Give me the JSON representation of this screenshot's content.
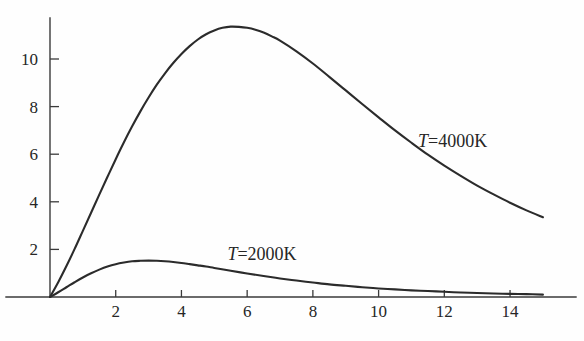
{
  "chart_data": {
    "type": "line",
    "title": "",
    "subtitle": "",
    "xlabel": "",
    "ylabel": "",
    "xlim": [
      0,
      15.1
    ],
    "ylim": [
      0,
      11.9
    ],
    "grid": false,
    "legend_position": "inline-annotation",
    "x_ticks": [
      "2",
      "4",
      "6",
      "8",
      "10",
      "12",
      "14"
    ],
    "x_tick_values": [
      2,
      4,
      6,
      8,
      10,
      12,
      14
    ],
    "y_ticks": [
      "2",
      "4",
      "6",
      "8",
      "10"
    ],
    "y_tick_values": [
      2,
      4,
      6,
      8,
      10
    ],
    "annotations": [
      {
        "text_var": "T",
        "text_eq": "=4000K",
        "x": 11.2,
        "y": 6.5
      },
      {
        "text_var": "T",
        "text_eq": "=2000K",
        "x": 5.4,
        "y": 1.75
      }
    ],
    "series": [
      {
        "name": "T=4000K",
        "color": "#2b2b2b",
        "peak_x": 5.65,
        "peak_y": 11.35,
        "x": [
          0,
          0.25,
          0.5,
          0.75,
          1,
          1.25,
          1.5,
          1.75,
          2,
          2.25,
          2.5,
          2.75,
          3,
          3.25,
          3.5,
          3.75,
          4,
          4.25,
          4.5,
          4.75,
          5,
          5.25,
          5.5,
          5.75,
          6,
          6.25,
          6.5,
          6.75,
          7,
          7.5,
          8,
          8.5,
          9,
          9.5,
          10,
          10.5,
          11,
          11.5,
          12,
          12.5,
          13,
          13.5,
          14,
          14.5,
          15
        ],
        "values": [
          0,
          0.62,
          1.3,
          2.02,
          2.78,
          3.54,
          4.3,
          5.05,
          5.79,
          6.5,
          7.17,
          7.8,
          8.38,
          8.92,
          9.4,
          9.83,
          10.21,
          10.54,
          10.82,
          11.04,
          11.2,
          11.31,
          11.36,
          11.35,
          11.31,
          11.23,
          11.11,
          10.95,
          10.77,
          10.32,
          9.81,
          9.25,
          8.68,
          8.11,
          7.55,
          7.0,
          6.48,
          5.98,
          5.52,
          5.09,
          4.68,
          4.31,
          3.96,
          3.64,
          3.35
        ]
      },
      {
        "name": "T=2000K",
        "color": "#2b2b2b",
        "peak_x": 2.9,
        "peak_y": 1.53,
        "x": [
          0,
          0.25,
          0.5,
          0.75,
          1,
          1.25,
          1.5,
          1.75,
          2,
          2.25,
          2.5,
          2.75,
          3,
          3.25,
          3.5,
          3.75,
          4,
          4.25,
          4.5,
          4.75,
          5,
          5.5,
          6,
          6.5,
          7,
          7.5,
          8,
          8.5,
          9,
          9.5,
          10,
          10.5,
          11,
          11.5,
          12,
          12.5,
          13,
          13.5,
          14,
          14.5,
          15
        ],
        "values": [
          0,
          0.2,
          0.41,
          0.62,
          0.82,
          1.0,
          1.15,
          1.28,
          1.38,
          1.45,
          1.5,
          1.52,
          1.53,
          1.52,
          1.5,
          1.47,
          1.43,
          1.38,
          1.33,
          1.28,
          1.22,
          1.1,
          0.99,
          0.88,
          0.78,
          0.69,
          0.61,
          0.53,
          0.47,
          0.41,
          0.36,
          0.32,
          0.28,
          0.25,
          0.22,
          0.19,
          0.17,
          0.15,
          0.13,
          0.12,
          0.1
        ]
      }
    ]
  },
  "figure": {
    "background_color": "#fefefe",
    "axis_color": "#3a3a3a",
    "curve_color": "#2b2b2b"
  }
}
